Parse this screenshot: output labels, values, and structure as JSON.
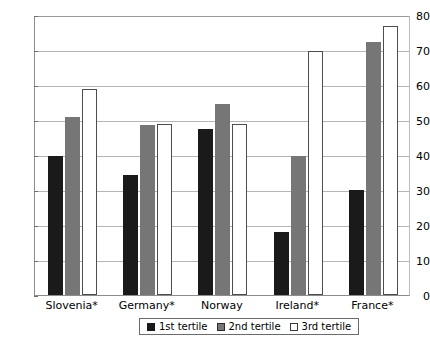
{
  "chart_data": {
    "type": "bar",
    "title": "",
    "xlabel": "",
    "ylabel": "",
    "ylim": [
      0,
      80
    ],
    "yticks": [
      0,
      10,
      20,
      30,
      40,
      50,
      60,
      70,
      80
    ],
    "grid": true,
    "legend_position": "bottom",
    "categories": [
      "Slovenia*",
      "Germany*",
      "Norway",
      "Ireland*",
      "France*"
    ],
    "series": [
      {
        "name": "1st tertile",
        "color": "#1a1a1a",
        "values": [
          39.7,
          34.3,
          47.5,
          18.0,
          30.0
        ]
      },
      {
        "name": "2nd tertile",
        "color": "#767676",
        "values": [
          51.0,
          48.5,
          54.5,
          39.8,
          72.3
        ]
      },
      {
        "name": "3rd tertile",
        "color": "#ffffff",
        "values": [
          59.0,
          49.0,
          49.0,
          69.7,
          77.0
        ]
      }
    ]
  },
  "axis": {
    "y_tick_labels": [
      "0",
      "10",
      "20",
      "30",
      "40",
      "50",
      "60",
      "70",
      "80"
    ],
    "x_tick_labels": [
      "Slovenia*",
      "Germany*",
      "Norway",
      "Ireland*",
      "France*"
    ]
  },
  "legend": {
    "entries": [
      {
        "label": "1st tertile",
        "swatch": "black-square-icon"
      },
      {
        "label": "2nd tertile",
        "swatch": "gray-square-icon"
      },
      {
        "label": "3rd tertile",
        "swatch": "white-square-icon"
      }
    ]
  }
}
